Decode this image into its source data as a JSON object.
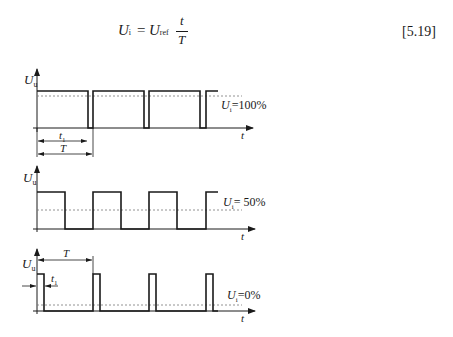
{
  "equation": {
    "lhs_symbol": "U",
    "lhs_sub": "i",
    "equals": "=",
    "rhs_symbol": "U",
    "rhs_sub": "ref",
    "numerator": "t",
    "denominator": "T",
    "number": "[5.19]"
  },
  "axes": {
    "y_label_symbol": "U",
    "y_label_sub": "u",
    "x_label": "t"
  },
  "plots": [
    {
      "id": "duty-high",
      "label_symbol": "U",
      "label_sub": "i",
      "label_value": "=100%",
      "annotations": {
        "t1": "t",
        "t1_sub": "1",
        "period": "T"
      }
    },
    {
      "id": "duty-half",
      "label_symbol": "U",
      "label_sub": "i",
      "label_value": "= 50%"
    },
    {
      "id": "duty-low",
      "label_symbol": "U",
      "label_sub": "i",
      "label_value": "=0%",
      "annotations": {
        "t1": "t",
        "t1_sub": "1",
        "period": "T"
      }
    }
  ],
  "colors": {
    "line": "#1a1a1a",
    "dashed": "#777777",
    "background": "#ffffff"
  }
}
